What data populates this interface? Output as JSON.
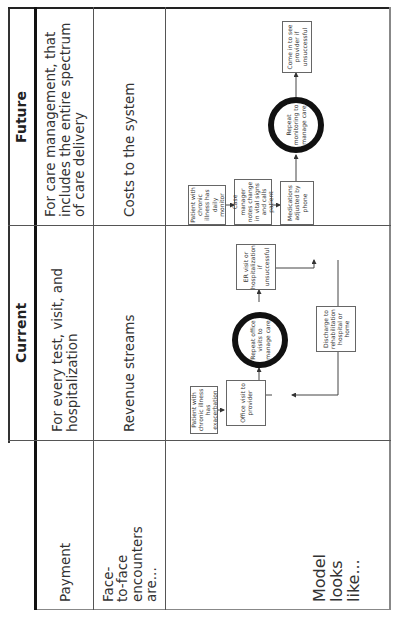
{
  "table": {
    "columns": [
      "",
      "Current",
      "Future"
    ],
    "rows": [
      {
        "label": "Payment",
        "current": "For every test, visit, and hospitalization",
        "future": "For care management, that includes the entire spectrum of care delivery"
      },
      {
        "label": "Face-to-face encounters are...",
        "label_lines": [
          "Face-",
          "to-face",
          "encounters",
          "are..."
        ],
        "current": "Revenue streams",
        "future": "Costs to the system"
      },
      {
        "label": "Model looks like...",
        "label_lines": [
          "Model",
          "looks",
          "like..."
        ]
      }
    ]
  },
  "current_model": {
    "nodes": [
      {
        "id": "patient",
        "text": "Patient with chronic illness has exacerbation"
      },
      {
        "id": "office",
        "text": "Office visit to provider"
      },
      {
        "id": "repeat",
        "text": "Repeat office visits to manage care",
        "shape": "cycle"
      },
      {
        "id": "er",
        "text": "ER visit or hospitalization if unsuccessful"
      },
      {
        "id": "discharge",
        "text": "Discharge to rehabilitation hospital or home"
      }
    ]
  },
  "future_model": {
    "nodes": [
      {
        "id": "patient",
        "text": "Patient with chronic illness has daily monitor"
      },
      {
        "id": "casemgr",
        "text": "Case manager notes change in vital signs and calls patient"
      },
      {
        "id": "meds",
        "text": "Medications adjusted by phone"
      },
      {
        "id": "repeat",
        "text": "Repeat monitoring to manage care",
        "shape": "cycle"
      },
      {
        "id": "comein",
        "text": "Come in to see provider if unsuccessful"
      }
    ]
  }
}
